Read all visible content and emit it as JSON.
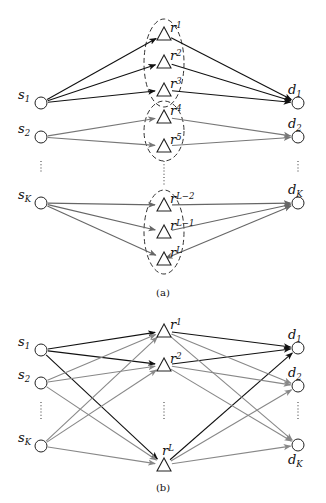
{
  "figure": {
    "panels": [
      {
        "id": "a",
        "caption": "(a)",
        "caption_pos": [
          163,
          296
        ],
        "sources": [
          {
            "label": "s",
            "sub": "1",
            "x": 41,
            "y": 103
          },
          {
            "label": "s",
            "sub": "2",
            "x": 41,
            "y": 137
          },
          {
            "label": "s",
            "sub": "K",
            "x": 41,
            "y": 203
          }
        ],
        "relays": [
          {
            "label": "r",
            "sub": "1",
            "x": 164,
            "y": 34
          },
          {
            "label": "r",
            "sub": "2",
            "x": 164,
            "y": 62
          },
          {
            "label": "r",
            "sub": "3",
            "x": 164,
            "y": 90
          },
          {
            "label": "r",
            "sub": "4",
            "x": 164,
            "y": 117
          },
          {
            "label": "r",
            "sub": "5",
            "x": 164,
            "y": 146
          },
          {
            "label": "r",
            "sub": "L−2",
            "x": 164,
            "y": 205
          },
          {
            "label": "r",
            "sub": "L−1",
            "x": 164,
            "y": 232
          },
          {
            "label": "r",
            "sub": "L",
            "x": 164,
            "y": 259
          }
        ],
        "destinations": [
          {
            "label": "d",
            "sub": "1",
            "x": 298,
            "y": 103
          },
          {
            "label": "d",
            "sub": "2",
            "x": 298,
            "y": 137
          },
          {
            "label": "d",
            "sub": "K",
            "x": 298,
            "y": 203
          }
        ],
        "clusters": [
          {
            "cx": 164,
            "cy": 63,
            "rx": 20,
            "ry": 44
          },
          {
            "cx": 164,
            "cy": 131,
            "rx": 20,
            "ry": 30
          },
          {
            "cx": 164,
            "cy": 232,
            "rx": 20,
            "ry": 42
          }
        ],
        "dots": [
          {
            "x": 41,
            "y1": 161,
            "y2": 172
          },
          {
            "x": 164,
            "y1": 161,
            "y2": 185
          },
          {
            "x": 298,
            "y1": 161,
            "y2": 172
          }
        ],
        "edges": [
          {
            "from": "s1",
            "to": "r1",
            "color": "#111111",
            "dir": "fwd"
          },
          {
            "from": "s1",
            "to": "r2",
            "color": "#111111",
            "dir": "fwd"
          },
          {
            "from": "s1",
            "to": "r3",
            "color": "#111111",
            "dir": "fwd"
          },
          {
            "from": "r1",
            "to": "d1",
            "color": "#111111",
            "dir": "fwd"
          },
          {
            "from": "r2",
            "to": "d1",
            "color": "#111111",
            "dir": "fwd"
          },
          {
            "from": "r3",
            "to": "d1",
            "color": "#111111",
            "dir": "fwd"
          },
          {
            "from": "s2",
            "to": "r4",
            "color": "#777777",
            "dir": "fwd"
          },
          {
            "from": "s2",
            "to": "r5",
            "color": "#777777",
            "dir": "fwd"
          },
          {
            "from": "r4",
            "to": "d2",
            "color": "#777777",
            "dir": "fwd"
          },
          {
            "from": "r5",
            "to": "d2",
            "color": "#777777",
            "dir": "fwd"
          },
          {
            "from": "sK",
            "to": "rL-2",
            "color": "#666666",
            "dir": "fwd"
          },
          {
            "from": "sK",
            "to": "rL-1",
            "color": "#666666",
            "dir": "fwd"
          },
          {
            "from": "sK",
            "to": "rL",
            "color": "#666666",
            "dir": "fwd"
          },
          {
            "from": "rL-2",
            "to": "dK",
            "color": "#666666",
            "dir": "fwd"
          },
          {
            "from": "rL-1",
            "to": "dK",
            "color": "#666666",
            "dir": "fwd"
          },
          {
            "from": "rL",
            "to": "dK",
            "color": "#666666",
            "dir": "both"
          }
        ]
      },
      {
        "id": "b",
        "caption": "(b)",
        "caption_pos": [
          163,
          491
        ],
        "sources": [
          {
            "label": "s",
            "sub": "1",
            "x": 41,
            "y": 350
          },
          {
            "label": "s",
            "sub": "2",
            "x": 41,
            "y": 383
          },
          {
            "label": "s",
            "sub": "K",
            "x": 41,
            "y": 446
          }
        ],
        "relays": [
          {
            "label": "r",
            "sub": "1",
            "x": 164,
            "y": 331
          },
          {
            "label": "r",
            "sub": "2",
            "x": 164,
            "y": 365
          },
          {
            "label": "r",
            "sub": "L",
            "x": 164,
            "y": 465
          }
        ],
        "destinations": [
          {
            "label": "d",
            "sub": "1",
            "x": 298,
            "y": 348
          },
          {
            "label": "d",
            "sub": "2",
            "x": 298,
            "y": 386
          },
          {
            "label": "d",
            "sub": "K",
            "x": 298,
            "y": 445
          }
        ],
        "clusters": [],
        "dots": [
          {
            "x": 41,
            "y1": 402,
            "y2": 420
          },
          {
            "x": 164,
            "y1": 402,
            "y2": 420
          },
          {
            "x": 298,
            "y1": 402,
            "y2": 420
          }
        ],
        "edges": [
          {
            "from": "s1",
            "to": "r1",
            "color": "#111111",
            "dir": "fwd"
          },
          {
            "from": "s1",
            "to": "r2",
            "color": "#111111",
            "dir": "fwd"
          },
          {
            "from": "s1",
            "to": "rL",
            "color": "#111111",
            "dir": "fwd"
          },
          {
            "from": "s2",
            "to": "r1",
            "color": "#888888",
            "dir": "fwd"
          },
          {
            "from": "s2",
            "to": "r2",
            "color": "#888888",
            "dir": "fwd"
          },
          {
            "from": "s2",
            "to": "rL",
            "color": "#888888",
            "dir": "fwd"
          },
          {
            "from": "sK",
            "to": "r1",
            "color": "#888888",
            "dir": "fwd"
          },
          {
            "from": "sK",
            "to": "r2",
            "color": "#888888",
            "dir": "fwd"
          },
          {
            "from": "sK",
            "to": "rL",
            "color": "#888888",
            "dir": "fwd"
          },
          {
            "from": "r1",
            "to": "d1",
            "color": "#111111",
            "dir": "fwd"
          },
          {
            "from": "r2",
            "to": "d1",
            "color": "#111111",
            "dir": "fwd"
          },
          {
            "from": "rL",
            "to": "d1",
            "color": "#111111",
            "dir": "fwd"
          },
          {
            "from": "r1",
            "to": "d2",
            "color": "#888888",
            "dir": "fwd"
          },
          {
            "from": "r2",
            "to": "d2",
            "color": "#888888",
            "dir": "fwd"
          },
          {
            "from": "rL",
            "to": "d2",
            "color": "#888888",
            "dir": "fwd"
          },
          {
            "from": "r1",
            "to": "dK",
            "color": "#888888",
            "dir": "fwd"
          },
          {
            "from": "r2",
            "to": "dK",
            "color": "#888888",
            "dir": "fwd"
          },
          {
            "from": "rL",
            "to": "dK",
            "color": "#888888",
            "dir": "fwd"
          }
        ]
      }
    ]
  }
}
